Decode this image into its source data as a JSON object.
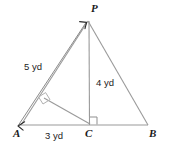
{
  "figure": {
    "background_color": "#ffffff",
    "stroke_color": "#9a9a9a",
    "label_color": "#1a1a1a",
    "measure_color": "#232323"
  },
  "vertices": [
    {
      "name": "A",
      "label": "A",
      "x": 20,
      "y": 125,
      "label_x": 13,
      "label_y": 128
    },
    {
      "name": "C",
      "label": "C",
      "x": 90,
      "y": 125,
      "label_x": 85,
      "label_y": 128
    },
    {
      "name": "B",
      "label": "B",
      "x": 148,
      "y": 125,
      "label_x": 149,
      "label_y": 128
    },
    {
      "name": "P",
      "label": "P",
      "x": 88,
      "y": 20,
      "label_x": 91,
      "label_y": 3
    }
  ],
  "measures": [
    {
      "name": "side-AP",
      "label": "5 yd",
      "value": 5,
      "unit": "yd",
      "label_x": 24,
      "label_y": 62
    },
    {
      "name": "altitude-CP",
      "label": "4 yd",
      "value": 4,
      "unit": "yd",
      "label_x": 96,
      "label_y": 78
    },
    {
      "name": "base-AC",
      "label": "3 yd",
      "value": 3,
      "unit": "yd",
      "label_x": 45,
      "label_y": 131
    }
  ],
  "segments": [
    {
      "name": "segment-AB-base",
      "from": "A",
      "to": "B"
    },
    {
      "name": "segment-AP",
      "from": "A",
      "to": "P"
    },
    {
      "name": "segment-PB",
      "from": "P",
      "to": "B"
    },
    {
      "name": "segment-CP-altitude",
      "from": "C",
      "to": "P"
    },
    {
      "name": "segment-C-to-AP-altitude",
      "from": "C",
      "to": "foot-on-AP"
    }
  ],
  "right_angles": [
    {
      "name": "right-angle-at-C",
      "x": 90,
      "y": 125
    },
    {
      "name": "right-angle-on-AP",
      "x": 45,
      "y": 99
    }
  ],
  "dimension_line": {
    "name": "dimension-line-5yd",
    "from_x": 18,
    "from_y": 126,
    "to_x": 86,
    "to_y": 23,
    "arrow_both_ends": true
  }
}
